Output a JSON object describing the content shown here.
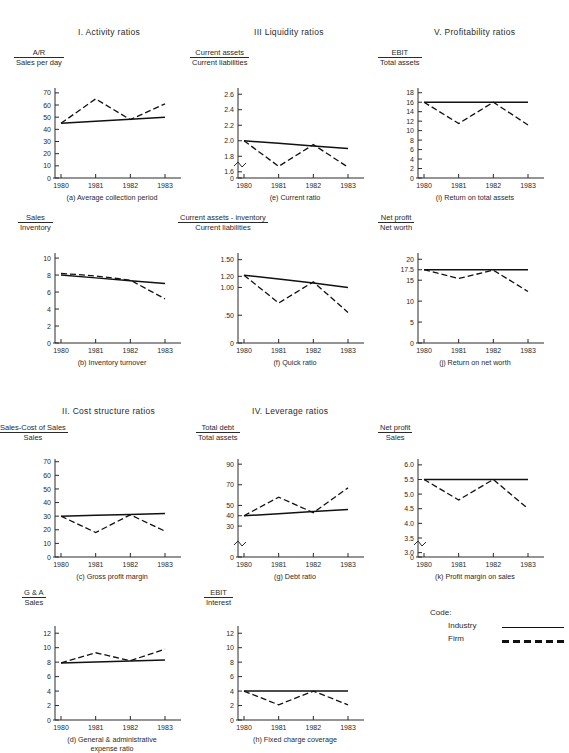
{
  "figure": {
    "sections": [
      {
        "id": "sec-activity",
        "label": "I. Activity ratios"
      },
      {
        "id": "sec-liquidity",
        "label": "III  Liquidity ratios"
      },
      {
        "id": "sec-profitability",
        "label": "V. Profitability ratios"
      },
      {
        "id": "sec-cost",
        "label": "II. Cost structure ratios"
      },
      {
        "id": "sec-leverage",
        "label": "IV. Leverage ratios"
      }
    ],
    "legend": {
      "title": "Code:",
      "entries": [
        {
          "label": "Industry",
          "style": "solid"
        },
        {
          "label": "Firm",
          "style": "dashed"
        }
      ]
    }
  },
  "chart_data": [
    {
      "id": "a",
      "type": "line",
      "title": "(a) Average collection period",
      "ylabel_numerator": "A/R",
      "ylabel_denominator": "Sales per day",
      "x": [
        "1980",
        "1981",
        "1982",
        "1983"
      ],
      "yticks": [
        0,
        10,
        20,
        30,
        40,
        50,
        60,
        70
      ],
      "ylim": [
        0,
        74
      ],
      "axis_break": false,
      "grid": false,
      "series": [
        {
          "name": "Industry",
          "style": "solid",
          "values": [
            45,
            46.6,
            48.3,
            50
          ]
        },
        {
          "name": "Firm",
          "style": "dashed",
          "values": [
            45,
            65,
            48,
            61
          ]
        }
      ]
    },
    {
      "id": "b",
      "type": "line",
      "title": "(b) Inventory turnover",
      "ylabel_numerator": "Sales",
      "ylabel_denominator": "Inventory",
      "x": [
        "1980",
        "1981",
        "1982",
        "1983"
      ],
      "yticks": [
        0,
        2,
        4,
        6,
        8,
        10
      ],
      "ylim": [
        0,
        10.6
      ],
      "axis_break": false,
      "grid": false,
      "series": [
        {
          "name": "Industry",
          "style": "solid",
          "values": [
            8.0,
            7.67,
            7.33,
            7.0
          ]
        },
        {
          "name": "Firm",
          "style": "dashed",
          "values": [
            8.2,
            7.9,
            7.4,
            5.2
          ]
        }
      ]
    },
    {
      "id": "c",
      "type": "line",
      "title": "(c) Gross profit margin",
      "ylabel_numerator": "Sales-Cost of Sales",
      "ylabel_denominator": "Sales",
      "x": [
        "1980",
        "1981",
        "1982",
        "1983"
      ],
      "yticks": [
        0,
        10,
        20,
        30,
        40,
        50,
        60,
        70
      ],
      "ylim": [
        0,
        72
      ],
      "axis_break": false,
      "grid": false,
      "series": [
        {
          "name": "Industry",
          "style": "solid",
          "values": [
            30,
            30.7,
            31.3,
            32
          ]
        },
        {
          "name": "Firm",
          "style": "dashed",
          "values": [
            30,
            18,
            31,
            19
          ]
        }
      ]
    },
    {
      "id": "d",
      "type": "line",
      "title": "(d) General & administrative",
      "title_line2": "expense ratio",
      "ylabel_numerator": "G & A",
      "ylabel_denominator": "Sales",
      "x": [
        "1980",
        "1981",
        "1982",
        "1983"
      ],
      "yticks": [
        0,
        2,
        4,
        6,
        8,
        10,
        12
      ],
      "ylim": [
        0,
        13
      ],
      "axis_break": false,
      "grid": false,
      "series": [
        {
          "name": "Industry",
          "style": "solid",
          "values": [
            7.9,
            8.03,
            8.17,
            8.3
          ]
        },
        {
          "name": "Firm",
          "style": "dashed",
          "values": [
            7.9,
            9.3,
            8.2,
            9.8
          ]
        }
      ]
    },
    {
      "id": "e",
      "type": "line",
      "title": "(e) Current ratio",
      "ylabel_numerator": "Current assets",
      "ylabel_denominator": "Current liabilities",
      "x": [
        "1980",
        "1981",
        "1982",
        "1983"
      ],
      "yticks": [
        0,
        1.6,
        1.8,
        2.0,
        2.2,
        2.4,
        2.6
      ],
      "yticklabels": [
        "0",
        "1.6",
        "1.8",
        "2.0",
        "2.2",
        "2.4",
        "2.6"
      ],
      "ylim": [
        1.52,
        2.68
      ],
      "axis_break": true,
      "grid": false,
      "series": [
        {
          "name": "Industry",
          "style": "solid",
          "values": [
            2.0,
            1.967,
            1.933,
            1.9
          ]
        },
        {
          "name": "Firm",
          "style": "dashed",
          "values": [
            2.0,
            1.67,
            1.95,
            1.66
          ]
        }
      ]
    },
    {
      "id": "f",
      "type": "line",
      "title": "(f) Quick ratio",
      "ylabel_numerator": "Current assets - inventory",
      "ylabel_denominator": "Current liabilities",
      "x": [
        "1980",
        "1981",
        "1982",
        "1983"
      ],
      "yticks": [
        0,
        0.5,
        1.0,
        1.2,
        1.5
      ],
      "yticklabels": [
        "0",
        ".50",
        "1.00",
        "1.20",
        "1.50"
      ],
      "ylim": [
        0,
        1.62
      ],
      "axis_break": false,
      "grid": false,
      "series": [
        {
          "name": "Industry",
          "style": "solid",
          "values": [
            1.22,
            1.15,
            1.08,
            1.0
          ]
        },
        {
          "name": "Firm",
          "style": "dashed",
          "values": [
            1.22,
            0.72,
            1.1,
            0.55
          ]
        }
      ]
    },
    {
      "id": "g",
      "type": "line",
      "title": "(g) Debt ratio",
      "ylabel_numerator": "Total debt",
      "ylabel_denominator": "Total assets",
      "x": [
        "1980",
        "1981",
        "1982",
        "1983"
      ],
      "yticks": [
        0,
        30,
        40,
        50,
        70,
        90
      ],
      "yticklabels": [
        "0",
        "30",
        "40",
        "50",
        "70",
        "90"
      ],
      "ylim": [
        0,
        95
      ],
      "axis_break": true,
      "grid": false,
      "series": [
        {
          "name": "Industry",
          "style": "solid",
          "values": [
            40,
            42,
            44,
            46
          ]
        },
        {
          "name": "Firm",
          "style": "dashed",
          "values": [
            40,
            58,
            43,
            67
          ]
        }
      ]
    },
    {
      "id": "h",
      "type": "line",
      "title": "(h) Fixed charge coverage",
      "ylabel_numerator": "EBIT",
      "ylabel_denominator": "Interest",
      "x": [
        "1980",
        "1981",
        "1982",
        "1983"
      ],
      "yticks": [
        0,
        2,
        4,
        6,
        8,
        10,
        12
      ],
      "ylim": [
        0,
        13
      ],
      "axis_break": false,
      "grid": false,
      "series": [
        {
          "name": "Industry",
          "style": "solid",
          "values": [
            4,
            4,
            4,
            4
          ]
        },
        {
          "name": "Firm",
          "style": "dashed",
          "values": [
            4,
            2.1,
            4,
            2.1
          ]
        }
      ]
    },
    {
      "id": "i",
      "type": "line",
      "title": "(i) Return on total assets",
      "ylabel_numerator": "EBIT",
      "ylabel_denominator": "Total assets",
      "x": [
        "1980",
        "1981",
        "1982",
        "1983"
      ],
      "yticks": [
        0,
        2,
        4,
        6,
        8,
        10,
        12,
        14,
        16,
        18
      ],
      "ylim": [
        0,
        19
      ],
      "axis_break": false,
      "grid": false,
      "series": [
        {
          "name": "Industry",
          "style": "solid",
          "values": [
            16,
            16,
            16,
            16
          ]
        },
        {
          "name": "Firm",
          "style": "dashed",
          "values": [
            16,
            11.5,
            16,
            11.2
          ]
        }
      ]
    },
    {
      "id": "j",
      "type": "line",
      "title": "(j) Return on net worth",
      "ylabel_numerator": "Net profit",
      "ylabel_denominator": "Net worth",
      "x": [
        "1980",
        "1981",
        "1982",
        "1983"
      ],
      "yticks": [
        0,
        5,
        10,
        15,
        17.5,
        20
      ],
      "yticklabels": [
        "0",
        "5",
        "10",
        "15",
        "17.5",
        "20"
      ],
      "ylim": [
        0,
        21.5
      ],
      "axis_break": false,
      "grid": false,
      "series": [
        {
          "name": "Industry",
          "style": "solid",
          "values": [
            17.5,
            17.5,
            17.5,
            17.5
          ]
        },
        {
          "name": "Firm",
          "style": "dashed",
          "values": [
            17.5,
            15.4,
            17.4,
            12.3
          ]
        }
      ]
    },
    {
      "id": "k",
      "type": "line",
      "title": "(k) Profit margin on sales",
      "ylabel_numerator": "Net profit",
      "ylabel_denominator": "Sales",
      "x": [
        "1980",
        "1981",
        "1982",
        "1983"
      ],
      "yticks": [
        0,
        3.0,
        3.5,
        4.0,
        4.5,
        5.0,
        5.5,
        6.0
      ],
      "yticklabels": [
        "0",
        "3.0",
        "3.5",
        "4.0",
        "4.5",
        "5.0",
        "5.5",
        "6.0"
      ],
      "ylim": [
        2.85,
        6.2
      ],
      "axis_break": true,
      "grid": false,
      "series": [
        {
          "name": "Industry",
          "style": "solid",
          "values": [
            5.5,
            5.5,
            5.5,
            5.5
          ]
        },
        {
          "name": "Firm",
          "style": "dashed",
          "values": [
            5.5,
            4.8,
            5.5,
            4.5
          ]
        }
      ]
    }
  ]
}
